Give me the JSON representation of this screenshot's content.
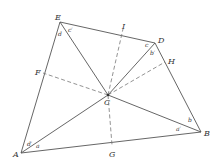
{
  "diagram": {
    "type": "geometry",
    "points": {
      "E": {
        "label": "E",
        "x": 60,
        "y": 22
      },
      "D": {
        "label": "D",
        "x": 155,
        "y": 43
      },
      "B": {
        "label": "B",
        "x": 201,
        "y": 132
      },
      "A": {
        "label": "A",
        "x": 21,
        "y": 153
      },
      "C": {
        "label": "C",
        "x": 108,
        "y": 95
      },
      "F": {
        "label": "F",
        "x": 43,
        "y": 73
      },
      "I": {
        "label": "I",
        "x": 123,
        "y": 29
      },
      "H": {
        "label": "H",
        "x": 165,
        "y": 62
      },
      "G": {
        "label": "G",
        "x": 112,
        "y": 145
      }
    },
    "solid_edges": [
      [
        "E",
        "D"
      ],
      [
        "D",
        "B"
      ],
      [
        "B",
        "A"
      ],
      [
        "A",
        "E"
      ],
      [
        "E",
        "C"
      ],
      [
        "D",
        "C"
      ],
      [
        "B",
        "C"
      ],
      [
        "A",
        "C"
      ]
    ],
    "dashed_edges": [
      [
        "C",
        "F"
      ],
      [
        "C",
        "I"
      ],
      [
        "C",
        "H"
      ],
      [
        "C",
        "G"
      ]
    ],
    "angle_labels": {
      "d": "d",
      "c_prime": "c′",
      "c": "c",
      "b_prime": "b′",
      "b": "b",
      "a_prime": "a′",
      "a": "a",
      "d_prime": "d′"
    },
    "colors": {
      "line": "#555555",
      "dashed": "#777777",
      "text": "#333333"
    }
  }
}
